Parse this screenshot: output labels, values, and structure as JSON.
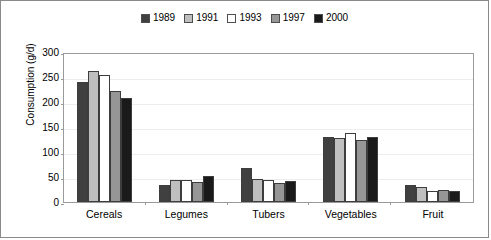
{
  "chart_data": {
    "type": "bar",
    "title": "",
    "xlabel": "",
    "ylabel": "Consumption (g/d)",
    "ylim": [
      0,
      300
    ],
    "yticks": [
      300,
      250,
      200,
      150,
      100,
      50,
      0
    ],
    "grid": true,
    "legend_position": "top-center",
    "categories": [
      "Cereals",
      "Legumes",
      "Tubers",
      "Vegetables",
      "Fruit"
    ],
    "series": [
      {
        "name": "1989",
        "color": "#404040",
        "values": [
          240,
          34,
          68,
          130,
          34
        ]
      },
      {
        "name": "1991",
        "color": "#bfbfbf",
        "values": [
          262,
          45,
          46,
          128,
          31
        ]
      },
      {
        "name": "1993",
        "color": "#ffffff",
        "values": [
          255,
          45,
          44,
          138,
          22
        ]
      },
      {
        "name": "1997",
        "color": "#969696",
        "values": [
          222,
          41,
          38,
          125,
          25
        ]
      },
      {
        "name": "2000",
        "color": "#1a1a1a",
        "values": [
          208,
          53,
          43,
          130,
          22
        ]
      }
    ]
  }
}
